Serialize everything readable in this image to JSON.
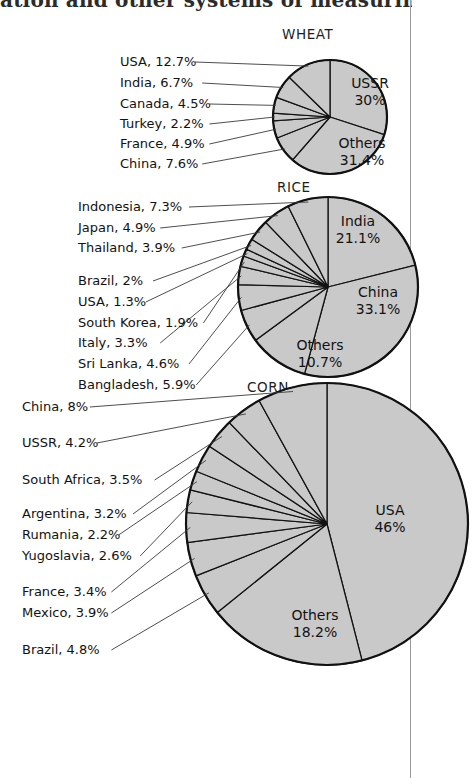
{
  "page": {
    "book_text_fragment": "ation and other systems of measuring",
    "column_rule_color": "#9a9a9a",
    "background_color": "#ffffff"
  },
  "style": {
    "slice_fill": "#c9c9c9",
    "slice_stroke": "#111111",
    "text_color": "#121212",
    "leader_color": "#3a3a3a"
  },
  "chart_data": [
    {
      "type": "pie",
      "title": "WHEAT",
      "labels": [
        "USSR",
        "Others",
        "China",
        "France",
        "Turkey",
        "Canada",
        "India",
        "USA"
      ],
      "values": [
        30,
        31.4,
        7.6,
        4.9,
        2.2,
        4.5,
        6.7,
        12.7
      ],
      "inner_labels": [
        {
          "name": "USSR",
          "value": "30%"
        },
        {
          "name": "Others",
          "value": "31.4%"
        }
      ],
      "callouts": [
        {
          "name": "USA",
          "value": "12.7%",
          "text": "USA, 12.7%"
        },
        {
          "name": "India",
          "value": "6.7%",
          "text": "India, 6.7%"
        },
        {
          "name": "Canada",
          "value": "4.5%",
          "text": "Canada, 4.5%"
        },
        {
          "name": "Turkey",
          "value": "2.2%",
          "text": "Turkey, 2.2%"
        },
        {
          "name": "France",
          "value": "4.9%",
          "text": "France, 4.9%"
        },
        {
          "name": "China",
          "value": "7.6%",
          "text": "China, 7.6%"
        }
      ]
    },
    {
      "type": "pie",
      "title": "RICE",
      "labels": [
        "India",
        "China",
        "Others",
        "Bangladesh",
        "Sri Lanka",
        "Italy",
        "South Korea",
        "USA",
        "Brazil",
        "Thailand",
        "Japan",
        "Indonesia"
      ],
      "values": [
        21.1,
        33.1,
        10.7,
        5.9,
        4.6,
        3.3,
        1.9,
        1.3,
        2,
        3.9,
        4.9,
        7.3
      ],
      "inner_labels": [
        {
          "name": "India",
          "value": "21.1%"
        },
        {
          "name": "China",
          "value": "33.1%"
        },
        {
          "name": "Others",
          "value": "10.7%"
        }
      ],
      "callouts": [
        {
          "name": "Indonesia",
          "value": "7.3%",
          "text": "Indonesia, 7.3%"
        },
        {
          "name": "Japan",
          "value": "4.9%",
          "text": "Japan, 4.9%"
        },
        {
          "name": "Thailand",
          "value": "3.9%",
          "text": "Thailand, 3.9%"
        },
        {
          "name": "Brazil",
          "value": "2%",
          "text": "Brazil, 2%"
        },
        {
          "name": "USA",
          "value": "1.3%",
          "text": "USA, 1.3%"
        },
        {
          "name": "South Korea",
          "value": "1.9%",
          "text": "South Korea, 1.9%"
        },
        {
          "name": "Italy",
          "value": "3.3%",
          "text": "Italy, 3.3%"
        },
        {
          "name": "Sri Lanka",
          "value": "4.6%",
          "text": "Sri Lanka, 4.6%"
        },
        {
          "name": "Bangladesh",
          "value": "5.9%",
          "text": "Bangladesh, 5.9%"
        }
      ]
    },
    {
      "type": "pie",
      "title": "CORN",
      "labels": [
        "USA",
        "Others",
        "Brazil",
        "Mexico",
        "France",
        "Yugoslavia",
        "Rumania",
        "Argentina",
        "South Africa",
        "USSR",
        "China"
      ],
      "values": [
        46,
        18.2,
        4.8,
        3.9,
        3.4,
        2.6,
        2.2,
        3.2,
        3.5,
        4.2,
        8
      ],
      "inner_labels": [
        {
          "name": "USA",
          "value": "46%"
        },
        {
          "name": "Others",
          "value": "18.2%"
        }
      ],
      "callouts": [
        {
          "name": "China",
          "value": "8%",
          "text": "China, 8%"
        },
        {
          "name": "USSR",
          "value": "4.2%",
          "text": "USSR, 4.2%"
        },
        {
          "name": "South Africa",
          "value": "3.5%",
          "text": "South Africa, 3.5%"
        },
        {
          "name": "Argentina",
          "value": "3.2%",
          "text": "Argentina, 3.2%"
        },
        {
          "name": "Rumania",
          "value": "2.2%",
          "text": "Rumania, 2.2%"
        },
        {
          "name": "Yugoslavia",
          "value": "2.6%",
          "text": "Yugoslavia, 2.6%"
        },
        {
          "name": "France",
          "value": "3.4%",
          "text": "France, 3.4%"
        },
        {
          "name": "Mexico",
          "value": "3.9%",
          "text": "Mexico, 3.9%"
        },
        {
          "name": "Brazil",
          "value": "4.8%",
          "text": "Brazil, 4.8%"
        }
      ]
    }
  ],
  "geometry": {
    "wheat": {
      "cx": 330,
      "cy": 117,
      "r": 57,
      "title_x": 282,
      "title_y": 39
    },
    "rice": {
      "cx": 328,
      "cy": 287,
      "r": 90,
      "title_x": 277,
      "title_y": 192
    },
    "corn": {
      "cx": 327,
      "cy": 524,
      "r": 141,
      "title_x": 247,
      "title_y": 392
    }
  },
  "callout_text_positions": {
    "wheat": [
      {
        "x": 120,
        "y": 66
      },
      {
        "x": 120,
        "y": 87
      },
      {
        "x": 120,
        "y": 108
      },
      {
        "x": 120,
        "y": 128
      },
      {
        "x": 120,
        "y": 148
      },
      {
        "x": 120,
        "y": 168
      }
    ],
    "rice": [
      {
        "x": 78,
        "y": 211
      },
      {
        "x": 78,
        "y": 232
      },
      {
        "x": 78,
        "y": 252
      },
      {
        "x": 78,
        "y": 285
      },
      {
        "x": 78,
        "y": 306
      },
      {
        "x": 78,
        "y": 327
      },
      {
        "x": 78,
        "y": 347
      },
      {
        "x": 78,
        "y": 368
      },
      {
        "x": 78,
        "y": 389
      }
    ],
    "corn": [
      {
        "x": 22,
        "y": 411
      },
      {
        "x": 22,
        "y": 447
      },
      {
        "x": 22,
        "y": 484
      },
      {
        "x": 22,
        "y": 518
      },
      {
        "x": 22,
        "y": 539
      },
      {
        "x": 22,
        "y": 560
      },
      {
        "x": 22,
        "y": 596
      },
      {
        "x": 22,
        "y": 617
      },
      {
        "x": 22,
        "y": 654
      }
    ]
  }
}
